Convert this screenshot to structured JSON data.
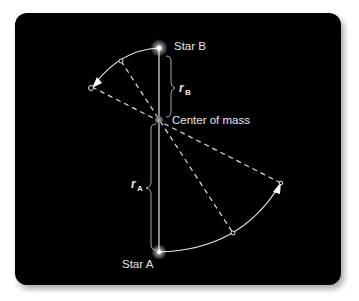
{
  "diagram": {
    "labels": {
      "star_b": "Star B",
      "star_a": "Star A",
      "center_of_mass": "Center of mass",
      "r_b_symbol": "r",
      "r_b_subscript": "B",
      "r_a_symbol": "r",
      "r_a_subscript": "A"
    },
    "colors": {
      "background": "#000000",
      "lines": "#e8e8e8",
      "center_of_mass": "#888888"
    },
    "nodes": [
      {
        "id": "star_b",
        "x": 159,
        "y": 48
      },
      {
        "id": "center_of_mass",
        "x": 159,
        "y": 120
      },
      {
        "id": "star_a",
        "x": 159,
        "y": 252
      }
    ],
    "edges": [
      {
        "from": "star_b",
        "to": "star_a",
        "style": "solid"
      },
      {
        "from": "upper_arc_mid",
        "to": "lower_arc_mid",
        "style": "dashed",
        "through": "center_of_mass"
      },
      {
        "from": "upper_arc_end",
        "to": "lower_arc_end",
        "style": "dashed",
        "through": "center_of_mass"
      }
    ]
  }
}
